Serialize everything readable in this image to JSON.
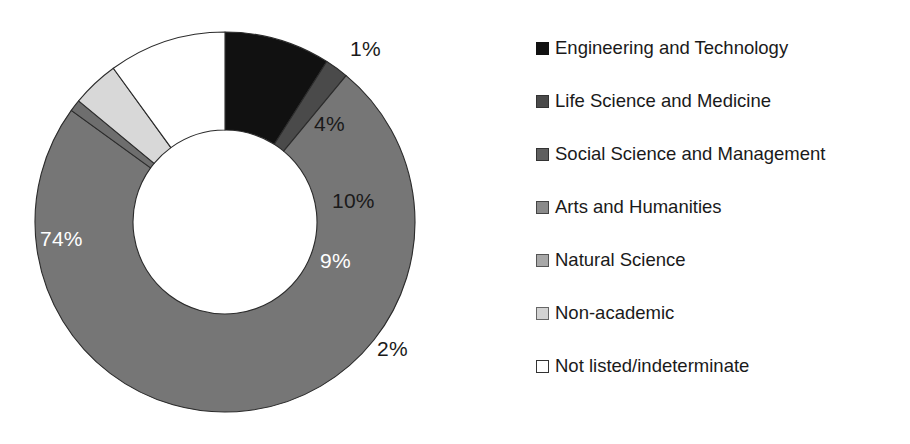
{
  "chart_data": {
    "type": "pie",
    "variant": "donut",
    "title": "",
    "subtitle": "",
    "xlabel": "",
    "ylabel": "",
    "grid": false,
    "legend_position": "right",
    "start_angle_deg": 0,
    "direction": "clockwise",
    "units": "percent",
    "categories": [
      "Engineering and Technology",
      "Life Science and Medicine",
      "Social Science and Management",
      "Arts and Humanities",
      "Natural Science",
      "Non-academic",
      "Not listed/indeterminate"
    ],
    "values": [
      9,
      2,
      74,
      0,
      1,
      4,
      10
    ],
    "slices": [
      {
        "category": "Engineering and Technology",
        "value": 9,
        "label": "9%",
        "color": "#111111",
        "label_color": "#ffffff",
        "label_inside": true
      },
      {
        "category": "Life Science and Medicine",
        "value": 2,
        "label": "2%",
        "color": "#4a4a4a",
        "label_color": "#1a1a1a",
        "label_inside": false
      },
      {
        "category": "Social Science and Management",
        "value": 74,
        "label": "74%",
        "color": "#767676",
        "label_color": "#ffffff",
        "label_inside": true
      },
      {
        "category": "Arts and Humanities",
        "value": 0,
        "label": "",
        "color": "#949494",
        "label_color": "#1a1a1a",
        "label_inside": false
      },
      {
        "category": "Natural Science",
        "value": 1,
        "label": "1%",
        "color": "#6e6e6e",
        "label_color": "#1a1a1a",
        "label_inside": false
      },
      {
        "category": "Non-academic",
        "value": 4,
        "label": "4%",
        "color": "#d8d8d8",
        "label_color": "#1a1a1a",
        "label_inside": true
      },
      {
        "category": "Not listed/indeterminate",
        "value": 10,
        "label": "10%",
        "color": "#ffffff",
        "label_color": "#1a1a1a",
        "label_inside": true
      }
    ]
  },
  "labels": {
    "s74": "74%",
    "s1": "1%",
    "s4": "4%",
    "s10": "10%",
    "s9": "9%",
    "s2": "2%"
  },
  "legend": {
    "items": [
      {
        "label": "Engineering and Technology",
        "color": "#111111",
        "border": "#111111"
      },
      {
        "label": "Life Science and Medicine",
        "color": "#4a4a4a",
        "border": "#333333"
      },
      {
        "label": "Social Science and Management",
        "color": "#5f5f5f",
        "border": "#333333"
      },
      {
        "label": "Arts and Humanities",
        "color": "#8a8a8a",
        "border": "#444444"
      },
      {
        "label": "Natural Science",
        "color": "#a8a8a8",
        "border": "#555555"
      },
      {
        "label": "Non-academic",
        "color": "#d2d2d2",
        "border": "#666666"
      },
      {
        "label": "Not listed/indeterminate",
        "color": "#ffffff",
        "border": "#333333"
      }
    ]
  },
  "colors": {
    "background": "#ffffff",
    "text": "#1a1a1a",
    "slice_outline": "#2b2b2b"
  }
}
